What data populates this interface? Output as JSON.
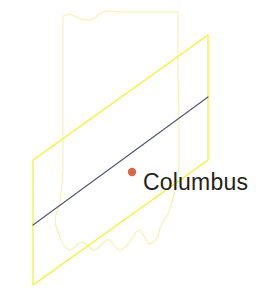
{
  "figure": {
    "name": "state-map-with-swath",
    "width": 273,
    "height": 294,
    "background_color": "#ffffff"
  },
  "state_outline": {
    "name": "Indiana",
    "stroke_color": "#f2f2b0",
    "stroke_width": 1.1,
    "fill": "none",
    "path": "M 63,22 L 63,16 L 70,14 L 76,17 L 83,20 L 90,20 L 96,17 L 100,13 L 106,11 L 112,11 L 118,12 L 124,12 L 178,12 L 178,44 L 178,78 L 179,112 L 179,140 L 179,168 L 176,186 L 172,202 L 168,214 L 164,220 L 160,228 L 158,236 L 154,242 L 150,244 L 146,240 L 143,234 L 140,230 L 136,232 L 132,238 L 128,244 L 124,248 L 120,250 L 116,248 L 113,244 L 110,240 L 106,240 L 102,244 L 98,248 L 94,250 L 90,248 L 86,244 L 82,242 L 78,244 L 74,248 L 70,250 L 66,248 L 63,244 L 60,238 L 58,232 L 56,226 L 55,220 L 56,214 L 58,208 L 60,202 L 61,194 L 62,184 L 63,170 L 63,140 L 63,100 L 63,60 Z"
  },
  "swath_parallelogram": {
    "name": "tilted-plane-overlay",
    "stroke_color": "#f2f22a",
    "stroke_width": 1.2,
    "fill": "none",
    "points": "33,160 208,35 208,160 33,285"
  },
  "track_line": {
    "name": "center-track-line",
    "stroke_color": "#565676",
    "stroke_width": 1.2,
    "x1": 33,
    "y1": 225,
    "x2": 208,
    "y2": 97
  },
  "city": {
    "name": "Columbus",
    "label": "Columbus",
    "label_color": "#231f20",
    "label_x": 143,
    "label_y": 190,
    "marker": {
      "name": "city-dot",
      "color": "#d9674a",
      "cx": 132,
      "cy": 172,
      "r": 4.2
    }
  },
  "colors": {
    "swath_yellow": "#f2f22a",
    "state_outline_pale": "#f2f2b0",
    "track_navy": "#565676",
    "marker_orange": "#d9674a",
    "label_black": "#231f20"
  }
}
